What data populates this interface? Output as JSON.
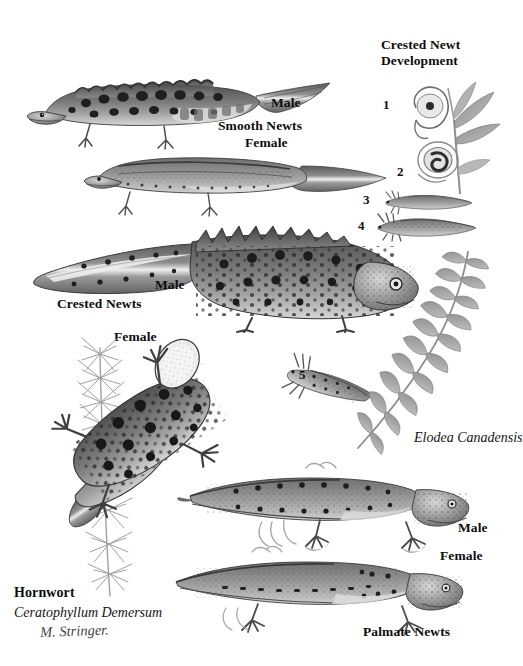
{
  "plate": {
    "title_block": {
      "heading_line1": "Crested Newt",
      "heading_line2": "Development"
    },
    "species_groups": [
      {
        "name": "smooth",
        "caption": "Smooth Newts",
        "male_label": "Male",
        "female_label": "Female"
      },
      {
        "name": "crested",
        "caption": "Crested Newts",
        "male_label": "Male",
        "female_label": "Female"
      },
      {
        "name": "palmate",
        "caption": "Palmate Newts",
        "male_label": "Male",
        "female_label": "Female"
      }
    ],
    "development_stages": [
      {
        "number": "1",
        "name": "egg-on-leaf"
      },
      {
        "number": "2",
        "name": "coiled-embryo"
      },
      {
        "number": "3",
        "name": "early-larva"
      },
      {
        "number": "4",
        "name": "gilled-larva"
      },
      {
        "number": "5",
        "name": "late-larva"
      }
    ],
    "plants": [
      {
        "common_name": "Hornwort",
        "scientific_name": "Ceratophyllum Demersum",
        "id": "hornwort"
      },
      {
        "common_name": "",
        "scientific_name": "Elodea Canadensis",
        "id": "elodea"
      }
    ],
    "signature": "M. Stringer.",
    "colors": {
      "background": "#ffffff",
      "ink": "#111111",
      "body_dark": "#5d5d5d",
      "body_mid": "#8a8a8a",
      "body_light": "#b9b9b9",
      "belly": "#d8d8d8",
      "spot": "#2a2a2a",
      "plant": "#9a9a9a"
    }
  }
}
